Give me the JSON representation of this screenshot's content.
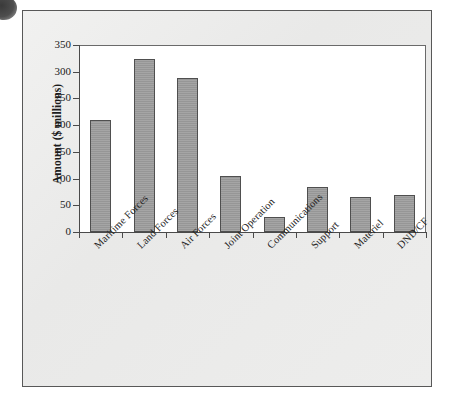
{
  "figure": {
    "background_color": "#ececeb",
    "frame_color": "#585858",
    "plot_background": "#ffffff",
    "bar_color": "#9b9b9b",
    "bar_outline_color": "#4f4f4f",
    "axis_color": "#4a4a4a"
  },
  "chart_data": {
    "type": "bar",
    "title": "",
    "xlabel": "",
    "ylabel": "Amount ($ millions)",
    "ylim": [
      0,
      350
    ],
    "ytick_labels": [
      "0",
      "50",
      "100",
      "150",
      "200",
      "250",
      "300",
      "350"
    ],
    "ytick_values": [
      0,
      50,
      100,
      150,
      200,
      250,
      300,
      350
    ],
    "ytick_interval": 50,
    "grid": false,
    "legend": false,
    "legend_position": "none",
    "categories": [
      "Maritime Forces",
      "Land Forces",
      "Air Forces",
      "Joint Operation",
      "Communications",
      "Support",
      "Materiel",
      "DND/CF"
    ],
    "values": [
      209,
      323,
      288,
      105,
      29,
      85,
      65,
      70
    ]
  }
}
